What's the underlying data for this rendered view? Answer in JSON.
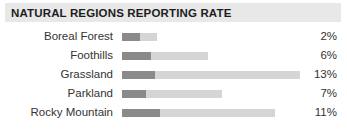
{
  "header": {
    "title": "NATURAL REGIONS REPORTING RATE",
    "band_color": "#e8e8e8",
    "text_color": "#1d1d1d"
  },
  "colors": {
    "background": "#ffffff",
    "bar_dark": "#8a8a8a",
    "bar_light": "#d5d5d5",
    "text": "#333333"
  },
  "chart_data": {
    "type": "bar",
    "title": "NATURAL REGIONS REPORTING RATE",
    "xlabel": "",
    "ylabel": "",
    "orientation": "horizontal",
    "grid": false,
    "legend": "none",
    "value_suffix": "%",
    "categories": [
      "Boreal Forest",
      "Foothills",
      "Grassland",
      "Parkland",
      "Rocky Mountain"
    ],
    "values": [
      2,
      6,
      13,
      7,
      11
    ],
    "value_labels": [
      "2%",
      "6%",
      "13%",
      "7%",
      "11%"
    ],
    "series": [
      {
        "name": "reported",
        "color": "#8a8a8a",
        "bar_px": [
          18,
          29,
          33,
          24,
          38
        ]
      },
      {
        "name": "remainder",
        "color": "#d5d5d5",
        "bar_px": [
          17,
          57,
          145,
          76,
          115
        ]
      }
    ],
    "rows": [
      {
        "label": "Boreal Forest",
        "value": 2,
        "value_label": "2%",
        "dark_px": 18,
        "light_px": 17
      },
      {
        "label": "Foothills",
        "value": 6,
        "value_label": "6%",
        "dark_px": 29,
        "light_px": 57
      },
      {
        "label": "Grassland",
        "value": 13,
        "value_label": "13%",
        "dark_px": 33,
        "light_px": 145
      },
      {
        "label": "Parkland",
        "value": 7,
        "value_label": "7%",
        "dark_px": 24,
        "light_px": 76
      },
      {
        "label": "Rocky Mountain",
        "value": 11,
        "value_label": "11%",
        "dark_px": 38,
        "light_px": 115
      }
    ]
  }
}
